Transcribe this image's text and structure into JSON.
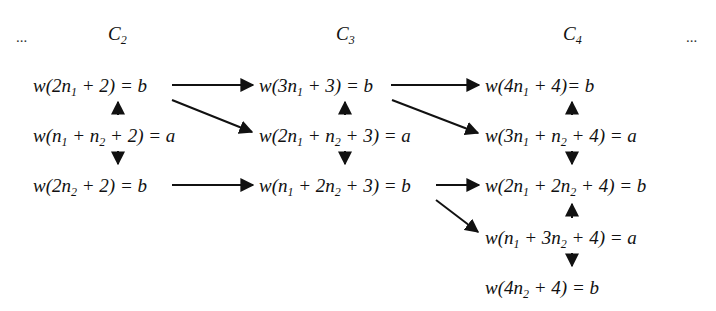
{
  "header": {
    "ellipsis_left": "...",
    "ellipsis_right": "...",
    "columns": [
      {
        "base": "C",
        "sub": "2"
      },
      {
        "base": "C",
        "sub": "3"
      },
      {
        "base": "C",
        "sub": "4"
      }
    ]
  },
  "nodes": {
    "c2": [
      {
        "pre": "w(2n",
        "s1": "1",
        "mid": " + 2) = b",
        "s2": "",
        "post": ""
      },
      {
        "pre": "w(n",
        "s1": "1",
        "mid": " + n",
        "s2": "2",
        "post": " + 2) = a"
      },
      {
        "pre": "w(2n",
        "s1": "2",
        "mid": " + 2) = b",
        "s2": "",
        "post": ""
      }
    ],
    "c3": [
      {
        "pre": "w(3n",
        "s1": "1",
        "mid": " + 3) = b",
        "s2": "",
        "post": ""
      },
      {
        "pre": "w(2n",
        "s1": "1",
        "mid": " + n",
        "s2": "2",
        "post": " + 3) = a"
      },
      {
        "pre": "w(n",
        "s1": "1",
        "mid": " + 2n",
        "s2": "2",
        "post": " + 3) = b"
      }
    ],
    "c4": [
      {
        "pre": "w(4n",
        "s1": "1",
        "mid": " + 4)= b",
        "s2": "",
        "post": ""
      },
      {
        "pre": "w(3n",
        "s1": "1",
        "mid": " + n",
        "s2": "2",
        "post": " + 4) = a"
      },
      {
        "pre": "w(2n",
        "s1": "1",
        "mid": " + 2n",
        "s2": "2",
        "post": " + 4) = b"
      },
      {
        "pre": "w(n",
        "s1": "1",
        "mid": " + 3n",
        "s2": "2",
        "post": " + 4) = a"
      },
      {
        "pre": "w(4n",
        "s1": "2",
        "mid": " + 4) = b",
        "s2": "",
        "post": ""
      }
    ]
  },
  "edges": [
    {
      "from": "c2.0",
      "to": "c3.0",
      "type": "horizontal"
    },
    {
      "from": "c2.0",
      "to": "c3.1",
      "type": "diagonal"
    },
    {
      "from": "c2.2",
      "to": "c3.2",
      "type": "horizontal"
    },
    {
      "from": "c2.1",
      "to": "c2.0",
      "type": "vertical-up"
    },
    {
      "from": "c2.1",
      "to": "c2.2",
      "type": "vertical-down"
    },
    {
      "from": "c3.0",
      "to": "c4.0",
      "type": "horizontal"
    },
    {
      "from": "c3.0",
      "to": "c4.1",
      "type": "diagonal"
    },
    {
      "from": "c3.2",
      "to": "c4.2",
      "type": "horizontal"
    },
    {
      "from": "c3.2",
      "to": "c4.3",
      "type": "diagonal"
    },
    {
      "from": "c3.1",
      "to": "c3.0",
      "type": "vertical-up"
    },
    {
      "from": "c3.1",
      "to": "c3.2",
      "type": "vertical-down"
    },
    {
      "from": "c4.1",
      "to": "c4.0",
      "type": "vertical-up"
    },
    {
      "from": "c4.1",
      "to": "c4.2",
      "type": "vertical-down"
    },
    {
      "from": "c4.3",
      "to": "c4.2",
      "type": "vertical-up"
    },
    {
      "from": "c4.3",
      "to": "c4.4",
      "type": "vertical-down"
    }
  ]
}
